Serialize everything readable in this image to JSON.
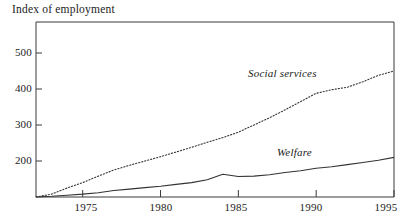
{
  "chart_data": {
    "type": "line",
    "title": "Index of employment",
    "xlabel": "",
    "ylabel": "",
    "xlim": [
      1972,
      1995
    ],
    "ylim": [
      100,
      530
    ],
    "grid": false,
    "legend_position": "inline-annotation",
    "yticks": [
      200,
      300,
      400,
      500
    ],
    "xticks": [
      1975,
      1980,
      1985,
      1990,
      1995
    ],
    "x": [
      1972,
      1973,
      1974,
      1975,
      1976,
      1977,
      1978,
      1979,
      1980,
      1981,
      1982,
      1983,
      1984,
      1985,
      1986,
      1987,
      1988,
      1989,
      1990,
      1991,
      1992,
      1993,
      1994,
      1995
    ],
    "series": [
      {
        "name": "Social services",
        "style": "dotted",
        "color": "#333333",
        "values": [
          100,
          108,
          125,
          140,
          158,
          175,
          188,
          200,
          212,
          225,
          238,
          252,
          265,
          280,
          300,
          320,
          342,
          365,
          388,
          398,
          405,
          420,
          438,
          450
        ]
      },
      {
        "name": "Welfare",
        "style": "solid",
        "color": "#333333",
        "values": [
          100,
          102,
          105,
          108,
          112,
          118,
          122,
          126,
          130,
          135,
          140,
          148,
          163,
          157,
          158,
          162,
          168,
          173,
          180,
          184,
          190,
          196,
          202,
          210
        ]
      }
    ],
    "annotations": [
      {
        "text": "Social services",
        "x": 1987.5,
        "y": 418
      },
      {
        "text": "Welfare",
        "x": 1988.5,
        "y": 243
      }
    ]
  },
  "axis": {
    "ytick_labels": [
      "500",
      "400",
      "300",
      "200"
    ],
    "xtick_labels": [
      "1975",
      "1980",
      "1985",
      "1990",
      "1995"
    ]
  }
}
